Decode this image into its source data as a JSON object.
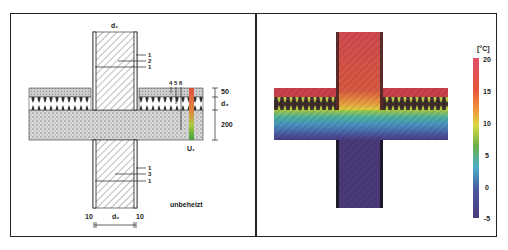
{
  "left_panel": {
    "title": "d₁",
    "layer_labels_top": [
      "1",
      "2",
      "1"
    ],
    "layer_labels_floor": [
      "4",
      "5",
      "6"
    ],
    "layer_labels_bottom": [
      "1",
      "3",
      "1"
    ],
    "dimensions_right": [
      "50",
      "d₃",
      "200"
    ],
    "probe_label": "U₁",
    "room_label": "unbeheizt",
    "dimensions_bottom": [
      "10",
      "d₂",
      "10"
    ]
  },
  "right_panel": {
    "legend_unit": "[°C]",
    "legend_ticks": [
      "20",
      "15",
      "10",
      "5",
      "0",
      "-5"
    ],
    "legend_colors": [
      "#e0506a",
      "#e8553a",
      "#f09a3a",
      "#d8d840",
      "#6ab04a",
      "#4ab0c8",
      "#4a5aa0",
      "#4a3a78"
    ]
  }
}
